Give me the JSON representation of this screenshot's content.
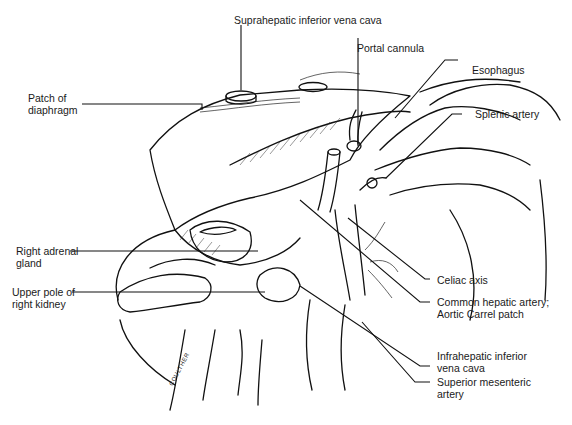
{
  "figure": {
    "type": "surgical anatomical line illustration",
    "labels": {
      "suprahepatic_ivc": [
        "Suprahepatic inferior vena cava"
      ],
      "portal_cannula": [
        "Portal cannula"
      ],
      "esophagus": [
        "Esophagus"
      ],
      "splenic_artery": [
        "Splenic artery"
      ],
      "patch_diaphragm": [
        "Patch of",
        "diaphragm"
      ],
      "right_adrenal": [
        "Right adrenal",
        "gland"
      ],
      "upper_pole_kidney": [
        "Upper pole of",
        "right kidney"
      ],
      "celiac_axis": [
        "Celiac axis"
      ],
      "common_hepatic": [
        "Common hepatic artery;",
        "Aortic Carrel patch"
      ],
      "infrahepatic_ivc": [
        "Infrahepatic inferior",
        "vena cava"
      ],
      "sma": [
        "Superior mesenteric",
        "artery"
      ]
    },
    "signature": "COULTHER"
  }
}
